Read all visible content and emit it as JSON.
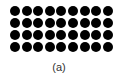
{
  "figure": {
    "caption": "(a)",
    "grid": {
      "rows": 4,
      "columns": 9,
      "dot_color": "#000000",
      "shape": "circle"
    }
  }
}
